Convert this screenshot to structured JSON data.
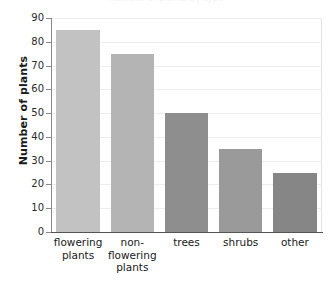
{
  "chart_data": {
    "type": "bar",
    "title": "",
    "xlabel": "",
    "ylabel": "Number of plants",
    "categories": [
      "flowering plants",
      "non-flowering plants",
      "trees",
      "shrubs",
      "other"
    ],
    "values": [
      85,
      75,
      50,
      35,
      25
    ],
    "yticks": [
      0,
      10,
      20,
      30,
      40,
      50,
      60,
      70,
      80,
      90
    ],
    "ylim": [
      0,
      90
    ],
    "grid": "horizontal",
    "legend": "none",
    "bar_colors": [
      "#c2c2c2",
      "#b4b4b4",
      "#8e8e8e",
      "#9a9a9a",
      "#868686"
    ],
    "axis_color": "#555555",
    "gridline_color": "#ededed"
  },
  "axis": {
    "y_title": "Number of plants",
    "tick_labels": [
      "90",
      "80",
      "70",
      "60",
      "50",
      "40",
      "30",
      "20",
      "10",
      "0"
    ],
    "category_labels": [
      [
        "flowering",
        "plants"
      ],
      [
        "non-",
        "flowering",
        "plants"
      ],
      [
        "trees"
      ],
      [
        "shrubs"
      ],
      [
        "other"
      ]
    ]
  },
  "cropped_title": "Number of plants by type"
}
